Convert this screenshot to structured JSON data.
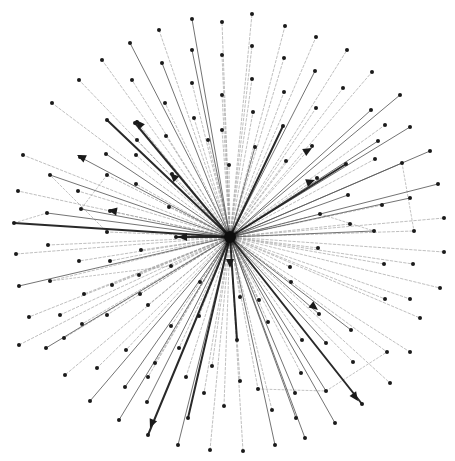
{
  "diagram": {
    "type": "directed-star-graph",
    "canvas": {
      "width": 455,
      "height": 461,
      "background": "#ffffff"
    },
    "colors": {
      "node": "#1a1a1a",
      "hub": "#0d0d0d",
      "edge_heavy": "#1e1e1e",
      "edge_solid": "#5a5a5a",
      "edge_dashed": "#9a9a9a"
    },
    "hub": {
      "id": "hub",
      "x": 230,
      "y": 237,
      "r": 6
    },
    "nodes": [
      {
        "id": "n1",
        "x": 252,
        "y": 14
      },
      {
        "id": "n2",
        "x": 285,
        "y": 26
      },
      {
        "id": "n3",
        "x": 316,
        "y": 37
      },
      {
        "id": "n4",
        "x": 347,
        "y": 50
      },
      {
        "id": "n5",
        "x": 372,
        "y": 72
      },
      {
        "id": "n6",
        "x": 400,
        "y": 95
      },
      {
        "id": "n7",
        "x": 410,
        "y": 127
      },
      {
        "id": "n8",
        "x": 430,
        "y": 151
      },
      {
        "id": "n9",
        "x": 438,
        "y": 184
      },
      {
        "id": "n10",
        "x": 444,
        "y": 218
      },
      {
        "id": "n11",
        "x": 444,
        "y": 252
      },
      {
        "id": "n12",
        "x": 440,
        "y": 288
      },
      {
        "id": "n13",
        "x": 420,
        "y": 318
      },
      {
        "id": "n14",
        "x": 410,
        "y": 352
      },
      {
        "id": "n15",
        "x": 390,
        "y": 383
      },
      {
        "id": "n16",
        "x": 362,
        "y": 404
      },
      {
        "id": "n17",
        "x": 335,
        "y": 423
      },
      {
        "id": "n18",
        "x": 305,
        "y": 438
      },
      {
        "id": "n19",
        "x": 275,
        "y": 445
      },
      {
        "id": "n20",
        "x": 243,
        "y": 451
      },
      {
        "id": "n21",
        "x": 210,
        "y": 450
      },
      {
        "id": "n22",
        "x": 178,
        "y": 445
      },
      {
        "id": "n23",
        "x": 148,
        "y": 435
      },
      {
        "id": "n24",
        "x": 119,
        "y": 420
      },
      {
        "id": "n25",
        "x": 90,
        "y": 401
      },
      {
        "id": "n26",
        "x": 65,
        "y": 375
      },
      {
        "id": "n27",
        "x": 46,
        "y": 348
      },
      {
        "id": "n28",
        "x": 29,
        "y": 317
      },
      {
        "id": "n29",
        "x": 19,
        "y": 286
      },
      {
        "id": "n30",
        "x": 16,
        "y": 254
      },
      {
        "id": "n31",
        "x": 14,
        "y": 223
      },
      {
        "id": "n32",
        "x": 18,
        "y": 191
      },
      {
        "id": "n33",
        "x": 23,
        "y": 155
      },
      {
        "id": "n34",
        "x": 52,
        "y": 103
      },
      {
        "id": "n35",
        "x": 79,
        "y": 80
      },
      {
        "id": "n36",
        "x": 102,
        "y": 60
      },
      {
        "id": "n37",
        "x": 130,
        "y": 43
      },
      {
        "id": "n38",
        "x": 159,
        "y": 30
      },
      {
        "id": "n39",
        "x": 192,
        "y": 19
      },
      {
        "id": "n40",
        "x": 222,
        "y": 22
      },
      {
        "id": "n41",
        "x": 252,
        "y": 46
      },
      {
        "id": "n42",
        "x": 252,
        "y": 79
      },
      {
        "id": "n43",
        "x": 253,
        "y": 112
      },
      {
        "id": "n44",
        "x": 284,
        "y": 58
      },
      {
        "id": "n45",
        "x": 284,
        "y": 92
      },
      {
        "id": "n46",
        "x": 315,
        "y": 71
      },
      {
        "id": "n47",
        "x": 316,
        "y": 108
      },
      {
        "id": "n48",
        "x": 343,
        "y": 88
      },
      {
        "id": "n49",
        "x": 371,
        "y": 110
      },
      {
        "id": "n50",
        "x": 385,
        "y": 125
      },
      {
        "id": "n51",
        "x": 378,
        "y": 141
      },
      {
        "id": "n52",
        "x": 402,
        "y": 163
      },
      {
        "id": "n53",
        "x": 375,
        "y": 159
      },
      {
        "id": "n54",
        "x": 410,
        "y": 198
      },
      {
        "id": "n55",
        "x": 382,
        "y": 205
      },
      {
        "id": "n56",
        "x": 374,
        "y": 231
      },
      {
        "id": "n57",
        "x": 414,
        "y": 231
      },
      {
        "id": "n58",
        "x": 384,
        "y": 264
      },
      {
        "id": "n59",
        "x": 413,
        "y": 264
      },
      {
        "id": "n60",
        "x": 410,
        "y": 299
      },
      {
        "id": "n61",
        "x": 385,
        "y": 299
      },
      {
        "id": "n62",
        "x": 351,
        "y": 330
      },
      {
        "id": "n63",
        "x": 387,
        "y": 352
      },
      {
        "id": "n64",
        "x": 353,
        "y": 362
      },
      {
        "id": "n65",
        "x": 326,
        "y": 343
      },
      {
        "id": "n66",
        "x": 319,
        "y": 314
      },
      {
        "id": "n67",
        "x": 302,
        "y": 340
      },
      {
        "id": "n68",
        "x": 326,
        "y": 391
      },
      {
        "id": "n69",
        "x": 295,
        "y": 393
      },
      {
        "id": "n70",
        "x": 301,
        "y": 373
      },
      {
        "id": "n71",
        "x": 296,
        "y": 418
      },
      {
        "id": "n72",
        "x": 258,
        "y": 389
      },
      {
        "id": "n73",
        "x": 272,
        "y": 410
      },
      {
        "id": "n74",
        "x": 240,
        "y": 381
      },
      {
        "id": "n75",
        "x": 268,
        "y": 322
      },
      {
        "id": "n76",
        "x": 237,
        "y": 340
      },
      {
        "id": "n77",
        "x": 224,
        "y": 406
      },
      {
        "id": "n78",
        "x": 212,
        "y": 366
      },
      {
        "id": "n79",
        "x": 204,
        "y": 393
      },
      {
        "id": "n80",
        "x": 188,
        "y": 418
      },
      {
        "id": "n81",
        "x": 186,
        "y": 377
      },
      {
        "id": "n82",
        "x": 179,
        "y": 348
      },
      {
        "id": "n83",
        "x": 147,
        "y": 402
      },
      {
        "id": "n84",
        "x": 148,
        "y": 377
      },
      {
        "id": "n85",
        "x": 155,
        "y": 363
      },
      {
        "id": "n86",
        "x": 125,
        "y": 387
      },
      {
        "id": "n87",
        "x": 126,
        "y": 350
      },
      {
        "id": "n88",
        "x": 97,
        "y": 368
      },
      {
        "id": "n89",
        "x": 82,
        "y": 324
      },
      {
        "id": "n90",
        "x": 107,
        "y": 315
      },
      {
        "id": "n91",
        "x": 60,
        "y": 315
      },
      {
        "id": "n92",
        "x": 64,
        "y": 338
      },
      {
        "id": "n93",
        "x": 50,
        "y": 281
      },
      {
        "id": "n94",
        "x": 84,
        "y": 294
      },
      {
        "id": "n95",
        "x": 140,
        "y": 294
      },
      {
        "id": "n96",
        "x": 112,
        "y": 285
      },
      {
        "id": "n97",
        "x": 139,
        "y": 275
      },
      {
        "id": "n98",
        "x": 171,
        "y": 266
      },
      {
        "id": "n99",
        "x": 19,
        "y": 345
      },
      {
        "id": "n100",
        "x": 48,
        "y": 245
      },
      {
        "id": "n101",
        "x": 79,
        "y": 261
      },
      {
        "id": "n102",
        "x": 110,
        "y": 261
      },
      {
        "id": "n103",
        "x": 141,
        "y": 250
      },
      {
        "id": "n104",
        "x": 47,
        "y": 213
      },
      {
        "id": "n105",
        "x": 81,
        "y": 209
      },
      {
        "id": "n106",
        "x": 110,
        "y": 211
      },
      {
        "id": "n107",
        "x": 107,
        "y": 232
      },
      {
        "id": "n108",
        "x": 78,
        "y": 191
      },
      {
        "id": "n109",
        "x": 50,
        "y": 175
      },
      {
        "id": "n110",
        "x": 107,
        "y": 175
      },
      {
        "id": "n111",
        "x": 136,
        "y": 184
      },
      {
        "id": "n112",
        "x": 106,
        "y": 154
      },
      {
        "id": "n113",
        "x": 80,
        "y": 157
      },
      {
        "id": "n114",
        "x": 136,
        "y": 155
      },
      {
        "id": "n115",
        "x": 107,
        "y": 120
      },
      {
        "id": "n116",
        "x": 137,
        "y": 122
      },
      {
        "id": "n117",
        "x": 135,
        "y": 123
      },
      {
        "id": "n118",
        "x": 137,
        "y": 140
      },
      {
        "id": "n119",
        "x": 165,
        "y": 103
      },
      {
        "id": "n120",
        "x": 192,
        "y": 83
      },
      {
        "id": "n121",
        "x": 192,
        "y": 50
      },
      {
        "id": "n122",
        "x": 162,
        "y": 63
      },
      {
        "id": "n123",
        "x": 132,
        "y": 80
      },
      {
        "id": "n124",
        "x": 222,
        "y": 55
      },
      {
        "id": "n125",
        "x": 222,
        "y": 95
      },
      {
        "id": "n126",
        "x": 222,
        "y": 130
      },
      {
        "id": "n127",
        "x": 194,
        "y": 118
      },
      {
        "id": "n128",
        "x": 166,
        "y": 136
      },
      {
        "id": "n129",
        "x": 229,
        "y": 165
      },
      {
        "id": "n130",
        "x": 255,
        "y": 147
      },
      {
        "id": "n131",
        "x": 283,
        "y": 126
      },
      {
        "id": "n132",
        "x": 286,
        "y": 161
      },
      {
        "id": "n133",
        "x": 312,
        "y": 146
      },
      {
        "id": "n134",
        "x": 317,
        "y": 178
      },
      {
        "id": "n135",
        "x": 346,
        "y": 164
      },
      {
        "id": "n136",
        "x": 348,
        "y": 195
      },
      {
        "id": "n137",
        "x": 320,
        "y": 214
      },
      {
        "id": "n138",
        "x": 350,
        "y": 224
      },
      {
        "id": "n139",
        "x": 318,
        "y": 248
      },
      {
        "id": "n140",
        "x": 290,
        "y": 267
      },
      {
        "id": "n141",
        "x": 291,
        "y": 282
      },
      {
        "id": "n142",
        "x": 259,
        "y": 300
      },
      {
        "id": "n143",
        "x": 240,
        "y": 297
      },
      {
        "id": "n144",
        "x": 199,
        "y": 316
      },
      {
        "id": "n145",
        "x": 171,
        "y": 326
      },
      {
        "id": "n146",
        "x": 148,
        "y": 305
      },
      {
        "id": "n147",
        "x": 200,
        "y": 282
      },
      {
        "id": "n148",
        "x": 176,
        "y": 237
      },
      {
        "id": "n149",
        "x": 169,
        "y": 207
      },
      {
        "id": "n150",
        "x": 172,
        "y": 174
      },
      {
        "id": "n151",
        "x": 208,
        "y": 140
      }
    ],
    "edges": [
      {
        "to": "n1",
        "style": "dashed"
      },
      {
        "to": "n2",
        "style": "dashed"
      },
      {
        "to": "n3",
        "style": "dashed"
      },
      {
        "to": "n4",
        "style": "dashed"
      },
      {
        "to": "n5",
        "style": "dashed"
      },
      {
        "to": "n6",
        "style": "solid"
      },
      {
        "to": "n7",
        "style": "solid"
      },
      {
        "to": "n8",
        "style": "solid"
      },
      {
        "to": "n9",
        "style": "solid"
      },
      {
        "to": "n10",
        "style": "dashed"
      },
      {
        "to": "n11",
        "style": "dashed"
      },
      {
        "to": "n12",
        "style": "dashed"
      },
      {
        "to": "n13",
        "style": "dashed"
      },
      {
        "to": "n14",
        "style": "dashed"
      },
      {
        "to": "n15",
        "style": "dashed"
      },
      {
        "to": "n16",
        "style": "heavy",
        "arrow": true
      },
      {
        "to": "n17",
        "style": "solid"
      },
      {
        "to": "n18",
        "style": "solid"
      },
      {
        "to": "n19",
        "style": "solid"
      },
      {
        "to": "n20",
        "style": "dashed"
      },
      {
        "to": "n21",
        "style": "dashed"
      },
      {
        "to": "n22",
        "style": "solid"
      },
      {
        "to": "n23",
        "style": "heavy",
        "arrow": true
      },
      {
        "to": "n24",
        "style": "solid"
      },
      {
        "to": "n25",
        "style": "solid"
      },
      {
        "to": "n26",
        "style": "dashed"
      },
      {
        "to": "n27",
        "style": "solid"
      },
      {
        "to": "n28",
        "style": "dashed"
      },
      {
        "to": "n29",
        "style": "solid"
      },
      {
        "to": "n30",
        "style": "dashed"
      },
      {
        "to": "n31",
        "style": "heavy"
      },
      {
        "to": "n32",
        "style": "dashed"
      },
      {
        "to": "n33",
        "style": "dashed"
      },
      {
        "to": "n34",
        "style": "dashed"
      },
      {
        "to": "n35",
        "style": "dashed"
      },
      {
        "to": "n36",
        "style": "dashed"
      },
      {
        "to": "n37",
        "style": "solid"
      },
      {
        "to": "n38",
        "style": "dashed"
      },
      {
        "to": "n39",
        "style": "solid"
      },
      {
        "to": "n40",
        "style": "dashed"
      },
      {
        "to": "n41",
        "style": "dashed"
      },
      {
        "to": "n42",
        "style": "dashed"
      },
      {
        "to": "n43",
        "style": "dashed"
      },
      {
        "to": "n44",
        "style": "dashed"
      },
      {
        "to": "n45",
        "style": "dashed"
      },
      {
        "to": "n46",
        "style": "solid"
      },
      {
        "to": "n47",
        "style": "dashed"
      },
      {
        "to": "n48",
        "style": "dashed"
      },
      {
        "to": "n49",
        "style": "solid"
      },
      {
        "to": "n50",
        "style": "dashed"
      },
      {
        "to": "n51",
        "style": "solid"
      },
      {
        "to": "n52",
        "style": "solid"
      },
      {
        "to": "n53",
        "style": "dashed"
      },
      {
        "to": "n54",
        "style": "solid"
      },
      {
        "to": "n55",
        "style": "dashed"
      },
      {
        "to": "n56",
        "style": "dashed"
      },
      {
        "to": "n57",
        "style": "dashed"
      },
      {
        "to": "n58",
        "style": "dashed"
      },
      {
        "to": "n59",
        "style": "dashed"
      },
      {
        "to": "n60",
        "style": "dashed"
      },
      {
        "to": "n61",
        "style": "dashed"
      },
      {
        "to": "n62",
        "style": "solid"
      },
      {
        "to": "n63",
        "style": "dashed"
      },
      {
        "to": "n64",
        "style": "dashed"
      },
      {
        "to": "n65",
        "style": "solid"
      },
      {
        "to": "n66",
        "style": "solid",
        "arrow": true
      },
      {
        "to": "n67",
        "style": "dashed"
      },
      {
        "to": "n68",
        "style": "solid"
      },
      {
        "to": "n69",
        "style": "solid"
      },
      {
        "to": "n71",
        "style": "solid"
      },
      {
        "to": "n73",
        "style": "dashed"
      },
      {
        "to": "n74",
        "style": "dashed"
      },
      {
        "to": "n76",
        "style": "heavy",
        "arrow": true,
        "arrow_at": 0.1
      },
      {
        "to": "n77",
        "style": "dashed"
      },
      {
        "to": "n79",
        "style": "dashed"
      },
      {
        "to": "n80",
        "style": "heavy",
        "arrow": true
      },
      {
        "to": "n83",
        "style": "solid"
      },
      {
        "to": "n86",
        "style": "solid"
      },
      {
        "to": "n88",
        "style": "dashed"
      },
      {
        "to": "n91",
        "style": "dashed"
      },
      {
        "to": "n93",
        "style": "dashed"
      },
      {
        "to": "n100",
        "style": "dashed"
      },
      {
        "to": "n104",
        "style": "solid"
      },
      {
        "to": "n105",
        "style": "solid",
        "arrow": true
      },
      {
        "to": "n109",
        "style": "solid"
      },
      {
        "to": "n113",
        "style": "solid"
      },
      {
        "to": "n112",
        "style": "solid"
      },
      {
        "to": "n115",
        "style": "heavy",
        "arrow": true
      },
      {
        "to": "n123",
        "style": "dashed"
      },
      {
        "to": "n119",
        "style": "dashed"
      },
      {
        "to": "n122",
        "style": "solid"
      },
      {
        "to": "n117",
        "style": "heavy",
        "arrow": true
      },
      {
        "to": "n121",
        "style": "solid"
      },
      {
        "to": "n124",
        "style": "dashed"
      },
      {
        "to": "n110",
        "style": "dashed"
      },
      {
        "to": "n130",
        "style": "solid"
      },
      {
        "to": "n135",
        "style": "heavy",
        "arrow": true
      },
      {
        "to": "n131",
        "style": "heavy",
        "arrow": true
      },
      {
        "to": "n148",
        "style": "heavy",
        "arrow": true
      },
      {
        "to": "n136",
        "style": "solid",
        "arrow": true
      },
      {
        "to": "n56",
        "style": "solid"
      }
    ],
    "cross_edges": [
      {
        "from": "n104",
        "to": "n31"
      },
      {
        "from": "n107",
        "to": "n109"
      },
      {
        "from": "n98",
        "to": "n93"
      },
      {
        "from": "n110",
        "to": "n105"
      },
      {
        "from": "n52",
        "to": "n57"
      },
      {
        "from": "n137",
        "to": "n56"
      },
      {
        "from": "n68",
        "to": "n63"
      },
      {
        "from": "n72",
        "to": "n68"
      }
    ],
    "arrow_heads": [
      {
        "x": 136,
        "y": 120,
        "angle": -130
      },
      {
        "x": 77,
        "y": 155,
        "angle": -155
      },
      {
        "x": 170,
        "y": 173,
        "angle": -135
      },
      {
        "x": 108,
        "y": 210,
        "angle": -170
      },
      {
        "x": 178,
        "y": 237,
        "angle": 180
      },
      {
        "x": 312,
        "y": 148,
        "angle": -30
      },
      {
        "x": 315,
        "y": 180,
        "angle": -20
      },
      {
        "x": 230,
        "y": 268,
        "angle": 90
      },
      {
        "x": 318,
        "y": 310,
        "angle": 38
      },
      {
        "x": 358,
        "y": 401,
        "angle": 55
      },
      {
        "x": 150,
        "y": 428,
        "angle": 112
      }
    ]
  }
}
